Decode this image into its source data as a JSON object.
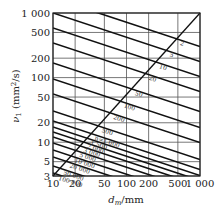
{
  "chart_data": {
    "type": "line",
    "title": "",
    "xlabel": "d_m/mm",
    "ylabel": "ν_1 (mm²/s)",
    "xscale": "log",
    "yscale": "log",
    "xlim": [
      10,
      1000
    ],
    "ylim": [
      3,
      1000
    ],
    "grid": true,
    "x_ticks": [
      "10",
      "20",
      "50",
      "100",
      "200",
      "500",
      "1 000"
    ],
    "x_tick_values": [
      10,
      20,
      50,
      100,
      200,
      500,
      1000
    ],
    "y_ticks": [
      "3",
      "5",
      "10",
      "20",
      "50",
      "100",
      "200",
      "500",
      "1 000"
    ],
    "y_tick_values": [
      3,
      5,
      10,
      20,
      50,
      100,
      200,
      500,
      1000
    ],
    "series_label_prefix": "n=",
    "series": [
      {
        "name": "2",
        "y_at_left": -2
      },
      {
        "name": "5",
        "y_at_left": 13
      },
      {
        "name": "10",
        "y_at_left": 28
      },
      {
        "name": "20",
        "y_at_left": 43
      },
      {
        "name": "50",
        "y_at_left": 63
      },
      {
        "name": "100",
        "y_at_left": 79
      },
      {
        "name": "200",
        "y_at_left": 94
      },
      {
        "name": "500",
        "y_at_left": 111
      },
      {
        "name": "1 000",
        "y_at_left": 121
      },
      {
        "name": "1 500",
        "y_at_left": 127
      },
      {
        "name": "2 000",
        "y_at_left": 132
      },
      {
        "name": "3 000",
        "y_at_left": 137
      },
      {
        "name": "5 000",
        "y_at_left": 143
      },
      {
        "name": "10 000",
        "y_at_left": 150
      },
      {
        "name": "20 000",
        "y_at_left": 157
      },
      {
        "name": "50 000",
        "y_at_left": 166
      },
      {
        "name": "100 000",
        "y_at_left": 173
      }
    ],
    "diagonal": {
      "from": [
        10,
        3
      ],
      "to": [
        1000,
        1000
      ]
    },
    "labels_along_diagonal": [
      "2",
      "5",
      "10",
      "20",
      "50",
      "100",
      "200",
      "500",
      "n=1 000",
      "1 500",
      "2 000",
      "3 000",
      "5 000",
      "10 000",
      "20 000",
      "50 000",
      "100 000"
    ]
  }
}
